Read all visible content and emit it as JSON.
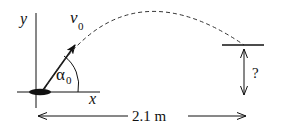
{
  "diagram": {
    "type": "projectile-motion",
    "labels": {
      "y_axis": "y",
      "x_axis": "x",
      "velocity": "v",
      "velocity_sub": "0",
      "angle": "α",
      "angle_sub": "0",
      "height_unknown": "?",
      "distance": "2.1 m"
    },
    "colors": {
      "stroke": "#111111",
      "background": "#ffffff"
    }
  }
}
